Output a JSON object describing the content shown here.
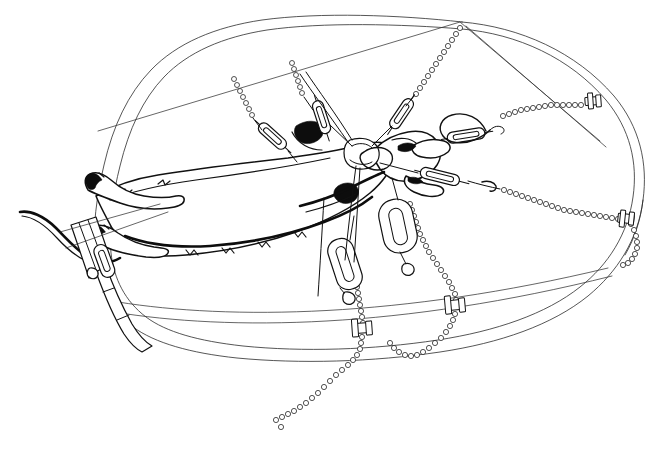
{
  "figure": {
    "style": "pen-and-ink technical line drawing",
    "background_color": "#ffffff",
    "ink_color": "#111111",
    "width": 655,
    "height": 452,
    "caption": ""
  },
  "subject": {
    "name": "rodent-specimen",
    "description": "Ventrally dissected rodent lying diagonally across the board, head to the right, tail to the lower left",
    "parts": [
      {
        "name": "tail",
        "label": "tail"
      },
      {
        "name": "hind-limb-left",
        "label": "left hind limb"
      },
      {
        "name": "hind-limb-right",
        "label": "right hind limb"
      },
      {
        "name": "torso",
        "label": "torso"
      },
      {
        "name": "fore-limb-upper",
        "label": "upper forelimb"
      },
      {
        "name": "fore-limb-lower",
        "label": "lower forelimb"
      },
      {
        "name": "head",
        "label": "head"
      },
      {
        "name": "skin-flap",
        "label": "reflected skin flap"
      }
    ]
  },
  "board": {
    "name": "dissection-board",
    "shape": "rounded rectangle in oblique perspective",
    "edge_count": 2,
    "label": "dissection board"
  },
  "hardware": {
    "turnbuckles": [
      {
        "id": "tb-1",
        "label": "turnbuckle 1",
        "position": "upper left"
      },
      {
        "id": "tb-2",
        "label": "turnbuckle 2",
        "position": "upper center"
      },
      {
        "id": "tb-3",
        "label": "turnbuckle 3",
        "position": "upper right of centre"
      },
      {
        "id": "tb-4",
        "label": "turnbuckle 4",
        "position": "right, to forelimb"
      },
      {
        "id": "tb-5",
        "label": "turnbuckle 5",
        "position": "lower right of centre"
      },
      {
        "id": "tb-6",
        "label": "turnbuckle 6",
        "position": "lower centre"
      },
      {
        "id": "tb-7",
        "label": "turnbuckle 7",
        "position": "lower left, to hind limb"
      }
    ],
    "chains": [
      {
        "id": "ch-1",
        "label": "bead chain 1",
        "anchor": "top edge left"
      },
      {
        "id": "ch-2",
        "label": "bead chain 2",
        "anchor": "top edge centre"
      },
      {
        "id": "ch-3",
        "label": "bead chain 3",
        "anchor": "top edge right"
      },
      {
        "id": "ch-4",
        "label": "bead chain 4",
        "anchor": "right edge upper clamp"
      },
      {
        "id": "ch-5",
        "label": "bead chain 5",
        "anchor": "right edge lower clamp"
      },
      {
        "id": "ch-6",
        "label": "bead chain 6",
        "anchor": "bottom edge left clamp"
      },
      {
        "id": "ch-7",
        "label": "bead chain 7",
        "anchor": "bottom edge right clamp"
      }
    ],
    "clamps": [
      {
        "id": "cl-1",
        "label": "edge clamp, upper right"
      },
      {
        "id": "cl-2",
        "label": "edge clamp, right"
      },
      {
        "id": "cl-3",
        "label": "edge clamp, bottom left"
      },
      {
        "id": "cl-4",
        "label": "edge clamp, bottom right"
      }
    ],
    "hooks": [
      {
        "id": "hk-1",
        "label": "wire eye hook, right"
      },
      {
        "id": "hk-2",
        "label": "wire eye hook, centre"
      }
    ],
    "retractor_bar": {
      "id": "rb-1",
      "label": "retractor bar across hind limbs"
    }
  }
}
